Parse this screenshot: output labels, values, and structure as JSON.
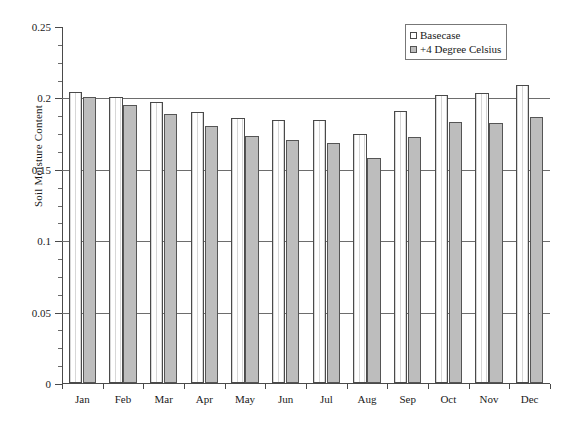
{
  "chart_data": {
    "type": "bar",
    "title": "",
    "xlabel": "",
    "ylabel": "Soil Moisture Content",
    "ylim": [
      0,
      0.25
    ],
    "ytick_labels": [
      "0",
      "0.05",
      "0.1",
      "0.15",
      "0.2",
      "0.25"
    ],
    "ytick_values": [
      0,
      0.05,
      0.1,
      0.15,
      0.2,
      0.25
    ],
    "minor_tick_step": 0.0125,
    "grid": "horizontal gridlines at 0.05, 0.1, 0.15, 0.2",
    "legend_position": "top-right",
    "categories": [
      "Jan",
      "Feb",
      "Mar",
      "Apr",
      "May",
      "Jun",
      "Jul",
      "Aug",
      "Sep",
      "Oct",
      "Nov",
      "Dec"
    ],
    "series": [
      {
        "name": "Basecase",
        "color": "#ffffff",
        "values": [
          0.2035,
          0.2,
          0.1965,
          0.19,
          0.1855,
          0.1845,
          0.184,
          0.1745,
          0.1905,
          0.2015,
          0.203,
          0.2085
        ]
      },
      {
        "name": "+4 Degree Celsius",
        "color": "#bdbdbd",
        "values": [
          0.2005,
          0.1945,
          0.1885,
          0.18,
          0.173,
          0.1705,
          0.168,
          0.1575,
          0.1725,
          0.1825,
          0.182,
          0.1865
        ]
      }
    ]
  },
  "legend": {
    "items": [
      {
        "label": "Basecase",
        "swatch": "base"
      },
      {
        "label": "+4 Degree Celsius",
        "swatch": "warm"
      }
    ]
  },
  "axes": {
    "y_axis_title": "Soil Moisture Content"
  }
}
